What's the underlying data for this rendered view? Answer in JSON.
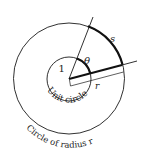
{
  "diagram": {
    "labels": {
      "one": "1",
      "theta": "θ",
      "s": "s",
      "r": "r",
      "unit_circle": "Unit circle",
      "outer_circle": "Circle of radius r"
    },
    "colors": {
      "stroke": "#1a1a1a",
      "background": "#ffffff"
    },
    "geometry": {
      "center": [
        69,
        79
      ],
      "unit_radius": 22,
      "outer_radius": 55.5
    }
  }
}
